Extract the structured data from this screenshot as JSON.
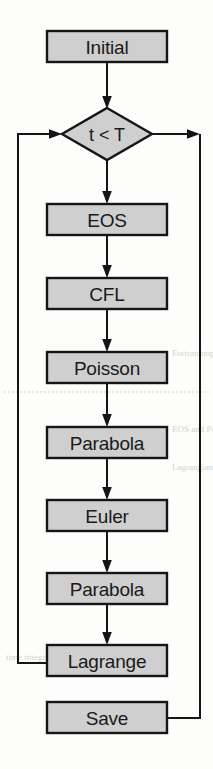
{
  "diagram": {
    "type": "flowchart",
    "canvas": {
      "width": 213,
      "height": 769
    },
    "colors": {
      "node_fill": "#cfcfcf",
      "node_border": "#151515",
      "edge": "#151515",
      "background": "#fdfdfb"
    },
    "nodes": [
      {
        "id": "initial",
        "label": "Initial",
        "shape": "process",
        "x": 47,
        "y": 31,
        "w": 120,
        "h": 31
      },
      {
        "id": "condition",
        "label": "t < T",
        "shape": "decision",
        "cx": 107,
        "cy": 134,
        "rx": 45,
        "ry": 26
      },
      {
        "id": "eos",
        "label": "EOS",
        "shape": "process",
        "x": 47,
        "y": 204,
        "w": 120,
        "h": 31
      },
      {
        "id": "cfl",
        "label": "CFL",
        "shape": "process",
        "x": 47,
        "y": 278,
        "w": 120,
        "h": 31
      },
      {
        "id": "poisson",
        "label": "Poisson",
        "shape": "process",
        "x": 47,
        "y": 352,
        "w": 120,
        "h": 31
      },
      {
        "id": "parabola1",
        "label": "Parabola",
        "shape": "process",
        "x": 47,
        "y": 427,
        "w": 120,
        "h": 31
      },
      {
        "id": "euler",
        "label": "Euler",
        "shape": "process",
        "x": 47,
        "y": 500,
        "w": 120,
        "h": 31
      },
      {
        "id": "parabola2",
        "label": "Parabola",
        "shape": "process",
        "x": 47,
        "y": 573,
        "w": 120,
        "h": 31
      },
      {
        "id": "lagrange",
        "label": "Lagrange",
        "shape": "process",
        "x": 47,
        "y": 645,
        "w": 120,
        "h": 31
      },
      {
        "id": "save",
        "label": "Save",
        "shape": "process",
        "x": 47,
        "y": 702,
        "w": 120,
        "h": 31
      }
    ],
    "edges": [
      {
        "id": "e-initial-condition",
        "from": "initial",
        "to": "condition",
        "kind": "straight-down",
        "arrow": true
      },
      {
        "id": "e-condition-eos",
        "from": "condition",
        "to": "eos",
        "kind": "straight-down",
        "arrow": true
      },
      {
        "id": "e-eos-cfl",
        "from": "eos",
        "to": "cfl",
        "kind": "straight-down",
        "arrow": true
      },
      {
        "id": "e-cfl-poisson",
        "from": "cfl",
        "to": "poisson",
        "kind": "straight-down",
        "arrow": true
      },
      {
        "id": "e-poisson-parabola1",
        "from": "poisson",
        "to": "parabola1",
        "kind": "straight-down",
        "arrow": true
      },
      {
        "id": "e-parabola1-euler",
        "from": "parabola1",
        "to": "euler",
        "kind": "straight-down",
        "arrow": true
      },
      {
        "id": "e-euler-parabola2",
        "from": "euler",
        "to": "parabola2",
        "kind": "straight-down",
        "arrow": true
      },
      {
        "id": "e-parabola2-lagrange",
        "from": "parabola2",
        "to": "lagrange",
        "kind": "straight-down",
        "arrow": true
      },
      {
        "id": "e-lagrange-loopback",
        "from": "lagrange",
        "to": "condition",
        "kind": "left-loop-up",
        "arrow": true
      },
      {
        "id": "e-condition-save",
        "from": "condition",
        "to": "save",
        "kind": "right-loop-down",
        "arrow": true
      }
    ],
    "bleed_through_text": [
      "Fortran implementation",
      "EOS and Poisson solvers",
      "Lagrangian remap step",
      "time integration loop"
    ]
  }
}
